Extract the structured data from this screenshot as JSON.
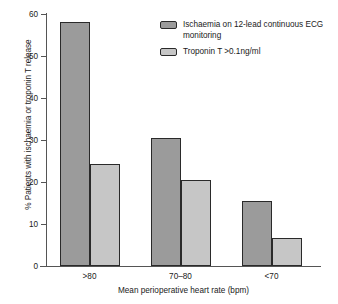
{
  "chart_data": {
    "type": "bar",
    "title": "",
    "subtitle": "",
    "categories": [
      ">80",
      "70–80",
      "<70"
    ],
    "series": [
      {
        "name": "Ischaemia on 12-lead continuous ECG monitoring",
        "color": "#9b9b9b",
        "values": [
          58.0,
          30.5,
          15.5
        ]
      },
      {
        "name": "Troponin T >0.1ng/ml",
        "color": "#c6c6c6",
        "values": [
          24.3,
          20.5,
          6.7
        ]
      }
    ],
    "xlabel": "Mean perioperative heart rate (bpm)",
    "ylabel": "% Patients with ischaemia or troponin T release",
    "ylim": [
      0,
      60
    ],
    "yticks": [
      0,
      10,
      20,
      30,
      40,
      50,
      60
    ],
    "ytick_labels": [
      "0",
      "10",
      "20",
      "30",
      "40",
      "50",
      "60"
    ],
    "grid": false,
    "legend_position": "top-right",
    "legend": [
      "Ischaemia on 12-lead continuous ECG monitoring",
      "Troponin T >0.1ng/ml"
    ]
  },
  "axes": {
    "y_title": "% Patients with ischaemia or troponin T release",
    "x_title": "Mean perioperative heart rate (bpm)"
  },
  "legend": {
    "entries": [
      {
        "label": "Ischaemia on 12-lead continuous ECG monitoring",
        "color": "#9b9b9b"
      },
      {
        "label": "Troponin T >0.1ng/ml",
        "color": "#c6c6c6"
      }
    ]
  }
}
